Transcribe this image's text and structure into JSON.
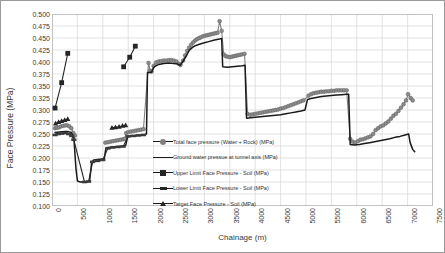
{
  "chart_data": {
    "type": "line",
    "title": "",
    "xlabel": "Chainage (m)",
    "ylabel": "Face Pressure (MPa)",
    "xlim": [
      0,
      7500
    ],
    "ylim": [
      0.1,
      0.5
    ],
    "ytick_step": 0.025,
    "xtick_step": 500,
    "grid": true,
    "legend_position": "inside-center",
    "yticks": [
      "0.500",
      "0.475",
      "0.450",
      "0.425",
      "0.400",
      "0.375",
      "0.350",
      "0.325",
      "0.300",
      "0.275",
      "0.250",
      "0.225",
      "0.200",
      "0.175",
      "0.150",
      "0.125",
      "0.100"
    ],
    "xticks": [
      "0",
      "500",
      "1000",
      "1500",
      "2000",
      "2500",
      "3000",
      "3500",
      "4000",
      "4500",
      "5000",
      "5500",
      "6000",
      "6500",
      "7000",
      "7500"
    ],
    "series": [
      {
        "name": "Total face pressure (Water + Rock) (MPa)",
        "marker": "circle",
        "color": "#7f7f7f",
        "points": [
          [
            60,
            0.262
          ],
          [
            100,
            0.263
          ],
          [
            140,
            0.264
          ],
          [
            180,
            0.266
          ],
          [
            220,
            0.267
          ],
          [
            260,
            0.268
          ],
          [
            300,
            0.268
          ],
          [
            340,
            0.266
          ],
          [
            380,
            0.262
          ],
          [
            420,
            0.252
          ],
          [
            450,
            0.247
          ],
          [
            1050,
            0.232
          ],
          [
            1100,
            0.233
          ],
          [
            1150,
            0.234
          ],
          [
            1200,
            0.235
          ],
          [
            1250,
            0.236
          ],
          [
            1300,
            0.237
          ],
          [
            1350,
            0.238
          ],
          [
            1400,
            0.239
          ],
          [
            1430,
            0.24
          ],
          [
            1460,
            0.252
          ],
          [
            1500,
            0.254
          ],
          [
            1550,
            0.255
          ],
          [
            1600,
            0.256
          ],
          [
            1650,
            0.257
          ],
          [
            1700,
            0.258
          ],
          [
            1750,
            0.259
          ],
          [
            1800,
            0.26
          ],
          [
            1900,
            0.398
          ],
          [
            1930,
            0.382
          ],
          [
            1960,
            0.38
          ],
          [
            2000,
            0.392
          ],
          [
            2050,
            0.399
          ],
          [
            2100,
            0.401
          ],
          [
            2150,
            0.402
          ],
          [
            2200,
            0.403
          ],
          [
            2250,
            0.403
          ],
          [
            2300,
            0.404
          ],
          [
            2350,
            0.404
          ],
          [
            2400,
            0.403
          ],
          [
            2450,
            0.401
          ],
          [
            2500,
            0.396
          ],
          [
            2530,
            0.394
          ],
          [
            2580,
            0.403
          ],
          [
            2620,
            0.414
          ],
          [
            2660,
            0.423
          ],
          [
            2700,
            0.43
          ],
          [
            2740,
            0.436
          ],
          [
            2780,
            0.441
          ],
          [
            2820,
            0.445
          ],
          [
            2860,
            0.448
          ],
          [
            2900,
            0.45
          ],
          [
            2940,
            0.452
          ],
          [
            2980,
            0.454
          ],
          [
            3020,
            0.455
          ],
          [
            3060,
            0.456
          ],
          [
            3100,
            0.457
          ],
          [
            3140,
            0.458
          ],
          [
            3180,
            0.459
          ],
          [
            3220,
            0.46
          ],
          [
            3260,
            0.461
          ],
          [
            3300,
            0.485
          ],
          [
            3340,
            0.465
          ],
          [
            3380,
            0.416
          ],
          [
            3420,
            0.412
          ],
          [
            3460,
            0.411
          ],
          [
            3500,
            0.41
          ],
          [
            3540,
            0.411
          ],
          [
            3580,
            0.412
          ],
          [
            3620,
            0.413
          ],
          [
            3660,
            0.414
          ],
          [
            3700,
            0.415
          ],
          [
            3740,
            0.416
          ],
          [
            3790,
            0.417
          ],
          [
            3850,
            0.292
          ],
          [
            3900,
            0.29
          ],
          [
            3950,
            0.291
          ],
          [
            4000,
            0.292
          ],
          [
            4050,
            0.293
          ],
          [
            4100,
            0.294
          ],
          [
            4150,
            0.295
          ],
          [
            4200,
            0.296
          ],
          [
            4250,
            0.297
          ],
          [
            4300,
            0.298
          ],
          [
            4350,
            0.299
          ],
          [
            4400,
            0.3
          ],
          [
            4450,
            0.301
          ],
          [
            4500,
            0.303
          ],
          [
            4550,
            0.304
          ],
          [
            4600,
            0.306
          ],
          [
            4650,
            0.308
          ],
          [
            4700,
            0.31
          ],
          [
            4750,
            0.312
          ],
          [
            4800,
            0.314
          ],
          [
            4850,
            0.316
          ],
          [
            4900,
            0.318
          ],
          [
            4950,
            0.32
          ],
          [
            5050,
            0.33
          ],
          [
            5100,
            0.333
          ],
          [
            5150,
            0.335
          ],
          [
            5200,
            0.336
          ],
          [
            5250,
            0.337
          ],
          [
            5300,
            0.338
          ],
          [
            5350,
            0.338
          ],
          [
            5400,
            0.339
          ],
          [
            5450,
            0.339
          ],
          [
            5500,
            0.34
          ],
          [
            5550,
            0.34
          ],
          [
            5600,
            0.341
          ],
          [
            5650,
            0.341
          ],
          [
            5700,
            0.341
          ],
          [
            5750,
            0.341
          ],
          [
            5800,
            0.341
          ],
          [
            5870,
            0.24
          ],
          [
            5920,
            0.234
          ],
          [
            5970,
            0.232
          ],
          [
            6020,
            0.235
          ],
          [
            6070,
            0.238
          ],
          [
            6120,
            0.239
          ],
          [
            6170,
            0.241
          ],
          [
            6220,
            0.243
          ],
          [
            6270,
            0.245
          ],
          [
            6320,
            0.25
          ],
          [
            6370,
            0.258
          ],
          [
            6420,
            0.262
          ],
          [
            6470,
            0.266
          ],
          [
            6520,
            0.268
          ],
          [
            6570,
            0.272
          ],
          [
            6620,
            0.276
          ],
          [
            6670,
            0.282
          ],
          [
            6720,
            0.288
          ],
          [
            6770,
            0.292
          ],
          [
            6820,
            0.298
          ],
          [
            6870,
            0.305
          ],
          [
            6920,
            0.312
          ],
          [
            6970,
            0.32
          ],
          [
            7010,
            0.333
          ],
          [
            7060,
            0.325
          ],
          [
            7100,
            0.32
          ]
        ]
      },
      {
        "name": "Ground water pressue at tunnel axis (MPa)",
        "marker": "none",
        "color": "#1a1a1a",
        "points": [
          [
            60,
            0.253
          ],
          [
            150,
            0.254
          ],
          [
            250,
            0.255
          ],
          [
            320,
            0.255
          ],
          [
            380,
            0.253
          ],
          [
            430,
            0.243
          ],
          [
            470,
            0.18
          ],
          [
            500,
            0.152
          ],
          [
            560,
            0.15
          ],
          [
            640,
            0.15
          ],
          [
            700,
            0.151
          ],
          [
            740,
            0.152
          ],
          [
            780,
            0.19
          ],
          [
            820,
            0.196
          ],
          [
            900,
            0.197
          ],
          [
            980,
            0.198
          ],
          [
            1030,
            0.199
          ],
          [
            1060,
            0.22
          ],
          [
            1100,
            0.222
          ],
          [
            1200,
            0.223
          ],
          [
            1300,
            0.224
          ],
          [
            1400,
            0.225
          ],
          [
            1450,
            0.226
          ],
          [
            1490,
            0.245
          ],
          [
            1550,
            0.246
          ],
          [
            1650,
            0.247
          ],
          [
            1750,
            0.248
          ],
          [
            1830,
            0.249
          ],
          [
            1860,
            0.25
          ],
          [
            1880,
            0.378
          ],
          [
            1930,
            0.378
          ],
          [
            1960,
            0.379
          ],
          [
            2010,
            0.39
          ],
          [
            2100,
            0.395
          ],
          [
            2200,
            0.397
          ],
          [
            2300,
            0.398
          ],
          [
            2400,
            0.397
          ],
          [
            2470,
            0.396
          ],
          [
            2520,
            0.393
          ],
          [
            2570,
            0.4
          ],
          [
            2640,
            0.412
          ],
          [
            2700,
            0.424
          ],
          [
            2760,
            0.43
          ],
          [
            2820,
            0.434
          ],
          [
            2900,
            0.437
          ],
          [
            3000,
            0.44
          ],
          [
            3100,
            0.443
          ],
          [
            3200,
            0.446
          ],
          [
            3300,
            0.448
          ],
          [
            3340,
            0.449
          ],
          [
            3360,
            0.39
          ],
          [
            3450,
            0.389
          ],
          [
            3550,
            0.39
          ],
          [
            3650,
            0.391
          ],
          [
            3750,
            0.392
          ],
          [
            3800,
            0.393
          ],
          [
            3830,
            0.283
          ],
          [
            3900,
            0.284
          ],
          [
            4000,
            0.285
          ],
          [
            4100,
            0.286
          ],
          [
            4200,
            0.287
          ],
          [
            4300,
            0.288
          ],
          [
            4400,
            0.289
          ],
          [
            4500,
            0.29
          ],
          [
            4600,
            0.292
          ],
          [
            4700,
            0.294
          ],
          [
            4800,
            0.296
          ],
          [
            4900,
            0.298
          ],
          [
            4980,
            0.3
          ],
          [
            5030,
            0.322
          ],
          [
            5100,
            0.324
          ],
          [
            5200,
            0.326
          ],
          [
            5300,
            0.328
          ],
          [
            5400,
            0.329
          ],
          [
            5500,
            0.33
          ],
          [
            5600,
            0.331
          ],
          [
            5700,
            0.332
          ],
          [
            5800,
            0.333
          ],
          [
            5840,
            0.333
          ],
          [
            5870,
            0.228
          ],
          [
            5950,
            0.227
          ],
          [
            6050,
            0.228
          ],
          [
            6150,
            0.23
          ],
          [
            6250,
            0.232
          ],
          [
            6350,
            0.234
          ],
          [
            6450,
            0.236
          ],
          [
            6550,
            0.238
          ],
          [
            6650,
            0.24
          ],
          [
            6750,
            0.243
          ],
          [
            6850,
            0.245
          ],
          [
            6950,
            0.248
          ],
          [
            7020,
            0.25
          ],
          [
            7050,
            0.232
          ],
          [
            7100,
            0.218
          ],
          [
            7140,
            0.213
          ]
        ]
      },
      {
        "name": "Upper Limit Face Pressure - Soil (MPa)",
        "marker": "square",
        "color": "#262626",
        "points": [
          [
            60,
            0.304
          ],
          [
            190,
            0.357
          ],
          [
            310,
            0.418
          ],
          [
            1410,
            0.39
          ],
          [
            1530,
            0.41
          ],
          [
            1640,
            0.433
          ]
        ]
      },
      {
        "name": "Lower Limit Face Pressure - Soil (MPa)",
        "marker": "dash",
        "color": "#262626",
        "points": [
          [
            60,
            0.248
          ],
          [
            120,
            0.25
          ],
          [
            190,
            0.251
          ],
          [
            260,
            0.252
          ],
          [
            330,
            0.25
          ],
          [
            390,
            0.246
          ],
          [
            430,
            0.238
          ],
          [
            640,
            0.15
          ],
          [
            720,
            0.151
          ],
          [
            800,
            0.192
          ],
          [
            900,
            0.194
          ],
          [
            1000,
            0.196
          ],
          [
            1100,
            0.22
          ],
          [
            1200,
            0.222
          ],
          [
            1300,
            0.223
          ],
          [
            1400,
            0.224
          ],
          [
            1500,
            0.245
          ],
          [
            1600,
            0.246
          ],
          [
            1700,
            0.247
          ],
          [
            1800,
            0.248
          ]
        ]
      },
      {
        "name": "Target Face Pressure - Soil (MPa)",
        "marker": "triangle",
        "color": "#262626",
        "points": [
          [
            70,
            0.272
          ],
          [
            130,
            0.275
          ],
          [
            190,
            0.277
          ],
          [
            250,
            0.279
          ],
          [
            310,
            0.281
          ],
          [
            1180,
            0.263
          ],
          [
            1250,
            0.264
          ],
          [
            1320,
            0.265
          ],
          [
            1390,
            0.267
          ],
          [
            1450,
            0.268
          ]
        ]
      }
    ]
  },
  "legend": {
    "items": [
      {
        "label": "Total face pressure (Water + Rock) (MPa)",
        "marker": "circle"
      },
      {
        "label": "Ground water pressue at tunnel axis (MPa)",
        "marker": "none"
      },
      {
        "label": "Upper Limit Face Pressure - Soil (MPa)",
        "marker": "square"
      },
      {
        "label": "Lower Limit Face Pressure - Soil (MPa)",
        "marker": "dash"
      },
      {
        "label": "Target Face Pressure - Soil (MPa)",
        "marker": "triangle"
      }
    ]
  }
}
